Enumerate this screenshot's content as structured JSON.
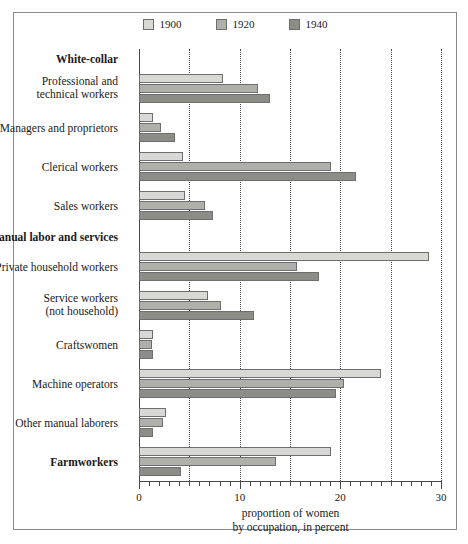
{
  "chart_data": {
    "type": "bar",
    "orientation": "horizontal",
    "title": "",
    "xlabel": "proportion of women\nby occupation, in percent",
    "xlabel_line1": "proportion of women",
    "xlabel_line2": "by occupation, in percent",
    "ylabel": "",
    "xlim": [
      0,
      30
    ],
    "xticks": [
      0,
      10,
      20,
      30
    ],
    "xtick_labels": [
      "0",
      "10",
      "20",
      "30"
    ],
    "gridlines": [
      5,
      10,
      15,
      20,
      25,
      30
    ],
    "grid": true,
    "legend": {
      "position": "top-center",
      "entries": [
        {
          "name": "1900",
          "color": "#d8d8d4"
        },
        {
          "name": "1920",
          "color": "#b0b0ab"
        },
        {
          "name": "1940",
          "color": "#8d8d88"
        }
      ]
    },
    "series": [
      {
        "name": "1900",
        "color": "#d8d8d4"
      },
      {
        "name": "1920",
        "color": "#b0b0ab"
      },
      {
        "name": "1940",
        "color": "#8d8d88"
      }
    ],
    "groups": [
      {
        "label": "White-collar",
        "type": "header"
      },
      {
        "label": "Professional and technical workers",
        "label_line1": "Professional and",
        "label_line2": "technical workers",
        "type": "category",
        "values": [
          8.3,
          11.8,
          13.0
        ]
      },
      {
        "label": "Managers and proprietors",
        "type": "category",
        "values": [
          1.4,
          2.2,
          3.6
        ]
      },
      {
        "label": "Clerical workers",
        "type": "category",
        "values": [
          4.4,
          19.1,
          21.6
        ]
      },
      {
        "label": "Sales workers",
        "type": "category",
        "values": [
          4.6,
          6.6,
          7.4
        ]
      },
      {
        "label": "Manual labor and services",
        "type": "header"
      },
      {
        "label": "Private household workers",
        "type": "category",
        "values": [
          28.8,
          15.7,
          17.9
        ]
      },
      {
        "label": "Service workers (not household)",
        "label_line1": "Service workers",
        "label_line2": "(not household)",
        "type": "category",
        "values": [
          6.9,
          8.1,
          11.4
        ]
      },
      {
        "label": "Craftswomen",
        "type": "category",
        "values": [
          1.4,
          1.3,
          1.4
        ]
      },
      {
        "label": "Machine operators",
        "type": "category",
        "values": [
          24.0,
          20.4,
          19.6
        ]
      },
      {
        "label": "Other manual laborers",
        "type": "category",
        "values": [
          2.7,
          2.4,
          1.4
        ]
      },
      {
        "label": "Farmworkers",
        "type": "header-category",
        "values": [
          19.1,
          13.6,
          4.2
        ]
      }
    ]
  },
  "colors": {
    "series_1900": "#d8d8d4",
    "series_1920": "#b0b0ab",
    "series_1940": "#8d8d88",
    "bar_stroke": "#6e6e6e",
    "axis": "#4a4a4a",
    "frame": "#8a8a8a",
    "text": "#1a1a1a",
    "background": "#ffffff"
  }
}
